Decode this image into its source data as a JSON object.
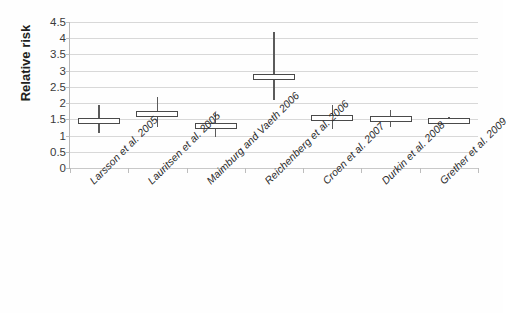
{
  "chart_data": {
    "type": "bar",
    "title": "",
    "xlabel": "",
    "ylabel": "Relative risk",
    "ylim": [
      0,
      4.5
    ],
    "ytick_labels": [
      "0",
      "0.5",
      "1",
      "1.5",
      "2",
      "2.5",
      "3",
      "3.5",
      "4",
      "4.5"
    ],
    "ytick_values": [
      0,
      0.5,
      1,
      1.5,
      2,
      2.5,
      3,
      3.5,
      4,
      4.5
    ],
    "grid": "horizontal",
    "legend": "none",
    "categories": [
      "Larsson et al. 2005",
      "Lauritsen et al. 2005",
      "Maimburg and Vaeth 2006",
      "Reichenberg et al. 2006",
      "Croen et al. 2007",
      "Durkin et al. 2008",
      "Grether et al. 2009"
    ],
    "values": [
      1.45,
      1.65,
      1.3,
      2.8,
      1.55,
      1.5,
      1.45
    ],
    "ci_low": [
      1.07,
      1.25,
      0.95,
      2.1,
      1.2,
      1.25,
      1.35
    ],
    "ci_high": [
      1.95,
      2.2,
      1.7,
      4.2,
      1.95,
      1.8,
      1.58
    ],
    "series": [
      {
        "name": "Relative risk with 95% confidence interval",
        "points": [
          {
            "category": "Larsson et al. 2005",
            "value": 1.45,
            "low": 1.07,
            "high": 1.95
          },
          {
            "category": "Lauritsen et al. 2005",
            "value": 1.65,
            "low": 1.25,
            "high": 2.2
          },
          {
            "category": "Maimburg and Vaeth 2006",
            "value": 1.3,
            "low": 0.95,
            "high": 1.7
          },
          {
            "category": "Reichenberg et al. 2006",
            "value": 2.8,
            "low": 2.1,
            "high": 4.2
          },
          {
            "category": "Croen et al. 2007",
            "value": 1.55,
            "low": 1.2,
            "high": 1.95
          },
          {
            "category": "Durkin et al. 2008",
            "value": 1.5,
            "low": 1.25,
            "high": 1.8
          },
          {
            "category": "Grether et al. 2009",
            "value": 1.45,
            "low": 1.35,
            "high": 1.58
          }
        ]
      }
    ],
    "colors": {
      "marker_line": "#4a4a4a",
      "whisker": "#5b5b5b",
      "gridline": "#d8d8d8",
      "axis": "#b0b0b0",
      "text": "#231f20",
      "background": "#ffffff"
    }
  }
}
